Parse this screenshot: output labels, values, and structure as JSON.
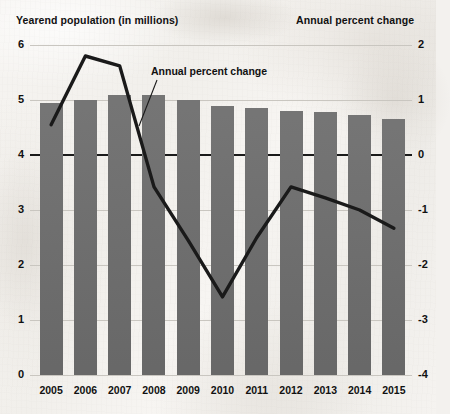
{
  "header": {
    "left_title": "Yearend population (in millions)",
    "right_title": "Annual percent change"
  },
  "annotation": {
    "label": "Annual percent change"
  },
  "axes": {
    "left_ticks": [
      "6",
      "5",
      "4",
      "3",
      "2",
      "1",
      "0"
    ],
    "right_ticks": [
      "2",
      "1",
      "0",
      "-1",
      "-2",
      "-3",
      "-4"
    ]
  },
  "colors": {
    "bar": "#6e6e6e",
    "line": "#1a1a1a",
    "grid": "#c9c6c0",
    "background": "#f3f1ee",
    "text": "#111111"
  },
  "chart_data": {
    "type": "bar",
    "title": "Yearend population (in millions)",
    "xlabel": "",
    "ylabel": "Yearend population (in millions)",
    "y2label": "Annual percent change",
    "ylim": [
      0,
      6
    ],
    "y2lim": [
      -4,
      2
    ],
    "grid": true,
    "legend": "annotation",
    "categories": [
      "2005",
      "2006",
      "2007",
      "2008",
      "2009",
      "2010",
      "2011",
      "2012",
      "2013",
      "2014",
      "2015"
    ],
    "series": [
      {
        "name": "Yearend population (in millions)",
        "type": "bar",
        "axis": "left",
        "values": [
          4.95,
          5.0,
          5.1,
          5.1,
          5.0,
          4.9,
          4.85,
          4.8,
          4.78,
          4.72,
          4.65
        ]
      },
      {
        "name": "Annual percent change",
        "type": "line",
        "axis": "right",
        "values": [
          0.55,
          1.8,
          1.62,
          -0.58,
          -1.55,
          -2.58,
          -1.5,
          -0.58,
          -0.78,
          -1.0,
          -1.33
        ]
      }
    ]
  }
}
